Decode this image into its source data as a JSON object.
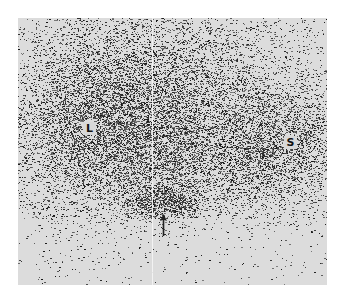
{
  "image": {
    "type": "scintigram",
    "description": "Grayscale nuclear medicine scan showing two large regions of uptake and a focal area of increased activity indicated by an arrow",
    "labels": [
      {
        "text": "L",
        "meaning_hint": "left region of uptake"
      },
      {
        "text": "S",
        "meaning_hint": "right region of uptake"
      }
    ],
    "annotations": [
      {
        "type": "arrow",
        "direction": "up",
        "target": "focal dark area near bottom center"
      }
    ],
    "colors": {
      "background": "#ffffff",
      "frame": "#dcdcdc",
      "dots": "#1a1a1a"
    }
  }
}
